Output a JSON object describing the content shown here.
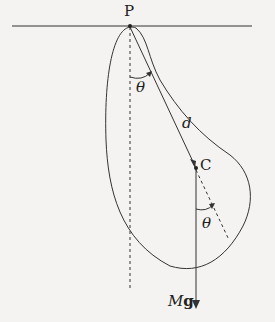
{
  "diagram": {
    "type": "physical pendulum free-body diagram",
    "labels": {
      "pivot": "P",
      "theta_top": "θ",
      "distance": "d",
      "center": "C",
      "theta_bottom": "θ",
      "force_M": "M",
      "force_g": "g"
    },
    "colors": {
      "line": "#333333",
      "background": "#f4f3f1"
    }
  }
}
